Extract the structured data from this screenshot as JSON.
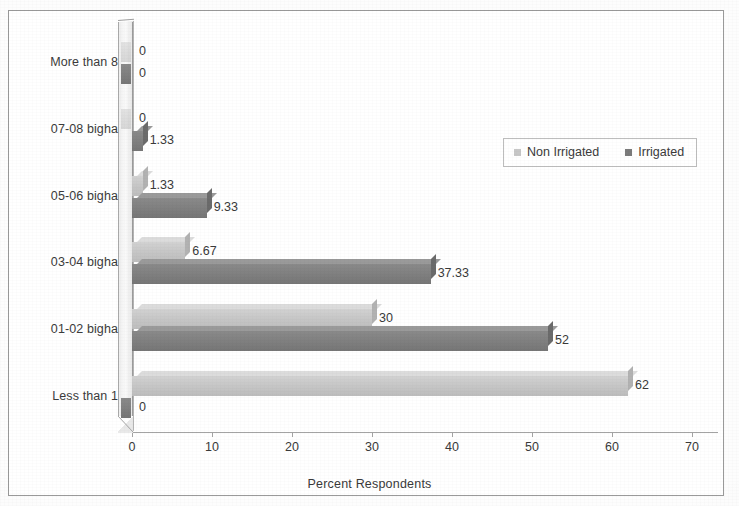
{
  "figure": {
    "border_color": "#9a9a9a",
    "background": "#ffffff"
  },
  "legend": {
    "position": "top-right",
    "entries": [
      {
        "label": "Non Irrigated",
        "color": "#c7c7c7"
      },
      {
        "label": "Irrigated",
        "color": "#7b7b7b"
      }
    ]
  },
  "axis": {
    "x_title": "Percent Respondents",
    "x_ticks": [
      "0",
      "10",
      "20",
      "30",
      "40",
      "50",
      "60",
      "70"
    ]
  },
  "chart_data": {
    "type": "bar",
    "orientation": "horizontal",
    "title": "",
    "subtitle": "",
    "xlabel": "Percent Respondents",
    "ylabel": "",
    "xlim": [
      0,
      70
    ],
    "xticks": [
      0,
      10,
      20,
      30,
      40,
      50,
      60,
      70
    ],
    "grid": false,
    "legend_position": "top-right",
    "style": "3d",
    "categories": [
      "Less than 1",
      "01-02 bigha",
      "03-04 bigha",
      "05-06 bigha",
      "07-08 bigha",
      "More than 8"
    ],
    "series": [
      {
        "name": "Non Irrigated",
        "color": "#c7c7c7",
        "values": [
          62,
          30,
          6.67,
          1.33,
          0,
          0
        ],
        "labels": [
          "62",
          "30",
          "6.67",
          "1.33",
          "0",
          "0"
        ]
      },
      {
        "name": "Irrigated",
        "color": "#7b7b7b",
        "values": [
          0,
          52,
          37.33,
          9.33,
          1.33,
          0
        ],
        "labels": [
          "0",
          "52",
          "37.33",
          "9.33",
          "1.33",
          "0"
        ]
      }
    ]
  }
}
